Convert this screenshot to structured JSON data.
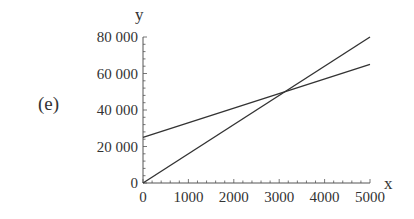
{
  "panel_label": "(e)",
  "chart_data": {
    "type": "line",
    "title": "",
    "xlabel": "x",
    "ylabel": "y",
    "xlim": [
      0,
      5000
    ],
    "ylim": [
      0,
      80000
    ],
    "x_ticks": [
      0,
      1000,
      2000,
      3000,
      4000,
      5000
    ],
    "x_tick_labels": [
      "0",
      "1000",
      "2000",
      "3000",
      "4000",
      "5000"
    ],
    "y_ticks": [
      0,
      20000,
      40000,
      60000,
      80000
    ],
    "y_tick_labels": [
      "0",
      "20 000",
      "40 000",
      "60 000",
      "80 000"
    ],
    "grid": false,
    "legend": null,
    "series": [
      {
        "name": "line 1",
        "x": [
          0,
          5000
        ],
        "y": [
          0,
          80000
        ],
        "color": "#333333"
      },
      {
        "name": "line 2",
        "x": [
          0,
          5000
        ],
        "y": [
          25000,
          65000
        ],
        "color": "#333333"
      }
    ],
    "annotations": [
      {
        "type": "intersection",
        "x": 3125,
        "y": 50000
      }
    ]
  }
}
